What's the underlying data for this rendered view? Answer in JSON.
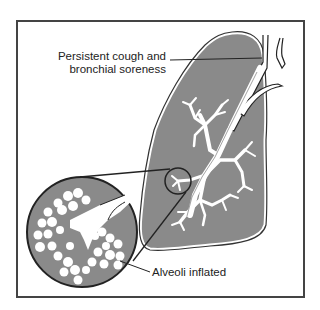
{
  "diagram": {
    "labels": {
      "bronchi_line1": "Persistent cough and",
      "bronchi_line2": "bronchial soreness",
      "alveoli": "Alveoli inflated"
    },
    "colors": {
      "lung_fill": "#8a8a8a",
      "outline": "#222222",
      "airway": "#ffffff",
      "frame": "#444444"
    },
    "callouts": [
      {
        "name": "bronchi-callout",
        "text_ref": "bronchi"
      },
      {
        "name": "alveoli-callout",
        "text_ref": "alveoli"
      }
    ]
  }
}
